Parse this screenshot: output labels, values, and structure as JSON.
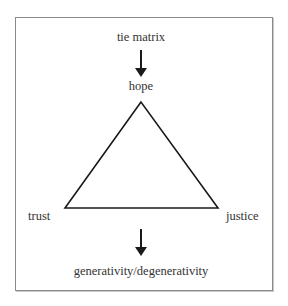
{
  "diagram": {
    "top_input": "tie matrix",
    "apex": "hope",
    "left_vertex": "trust",
    "right_vertex": "justice",
    "output": "generativity/degenerativity"
  },
  "colors": {
    "frame_border": "#8a8a8a",
    "line": "#1a1a1a",
    "text": "#333333",
    "background": "#ffffff"
  }
}
